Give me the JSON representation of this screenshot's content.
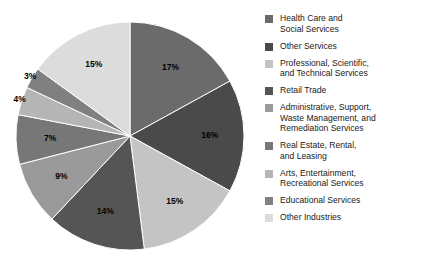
{
  "chart_data": {
    "type": "pie",
    "title": "",
    "legend_position": "right",
    "start_angle_deg": 0,
    "direction": "clockwise",
    "units": "percent",
    "categories": [
      "Health Care and Social Services",
      "Other Services",
      "Professional, Scientific, and Technical Services",
      "Retail Trade",
      "Administrative, Support, Waste Management, and Remediation Services",
      "Real Estate, Rental, and Leasing",
      "Arts, Entertainment, Recreational Services",
      "Educational Services",
      "Other Industries"
    ],
    "values": [
      17,
      16,
      15,
      14,
      9,
      7,
      4,
      3,
      15
    ],
    "value_labels": [
      "17%",
      "16%",
      "15%",
      "14%",
      "9%",
      "7%",
      "4%",
      "3%",
      "15%"
    ],
    "colors": [
      "#6b6b6b",
      "#4a4a4a",
      "#c4c4c4",
      "#555555",
      "#9a9a9a",
      "#777777",
      "#b5b5b5",
      "#808080",
      "#dcdcdc"
    ]
  },
  "legend": {
    "items": [
      {
        "label": "Health Care and\nSocial Services",
        "color": "#6b6b6b",
        "value_label": "17%"
      },
      {
        "label": "Other Services",
        "color": "#4a4a4a",
        "value_label": "16%"
      },
      {
        "label": "Professional, Scientific,\nand Technical Services",
        "color": "#c4c4c4",
        "value_label": "15%"
      },
      {
        "label": "Retail Trade",
        "color": "#555555",
        "value_label": "14%"
      },
      {
        "label": "Administrative, Support,\nWaste Management, and\nRemediation Services",
        "color": "#9a9a9a",
        "value_label": "9%"
      },
      {
        "label": "Real Estate, Rental,\nand Leasing",
        "color": "#777777",
        "value_label": "7%"
      },
      {
        "label": "Arts, Entertainment,\nRecreational Services",
        "color": "#b5b5b5",
        "value_label": "4%"
      },
      {
        "label": "Educational Services",
        "color": "#808080",
        "value_label": "3%"
      },
      {
        "label": "Other Industries",
        "color": "#dcdcdc",
        "value_label": "15%"
      }
    ]
  },
  "pie_geometry": {
    "cx": 130,
    "cy": 136,
    "r": 114
  }
}
